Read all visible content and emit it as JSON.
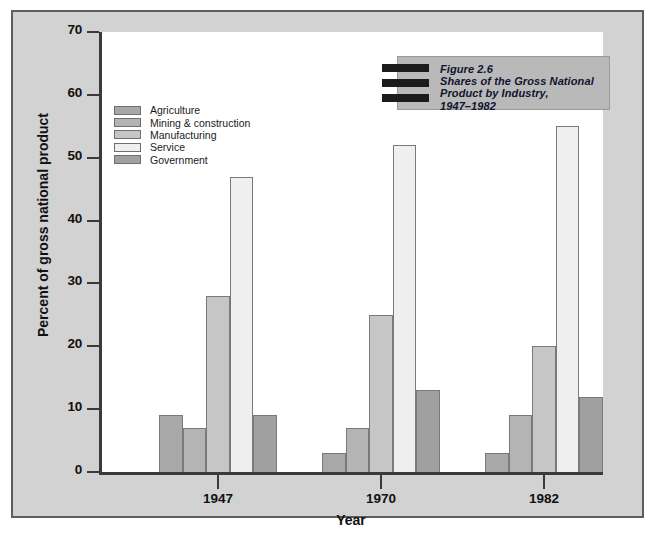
{
  "chart_data": {
    "type": "bar",
    "title_lines": [
      "Figure 2.6",
      "Shares of the Gross National",
      "Product by Industry,",
      "1947–1982"
    ],
    "xlabel": "Year",
    "ylabel": "Percent of gross national product",
    "categories": [
      "1947",
      "1970",
      "1982"
    ],
    "ylim": [
      0,
      70
    ],
    "yticks": [
      0,
      10,
      20,
      30,
      40,
      50,
      60,
      70
    ],
    "grid": false,
    "legend_position": "upper-left-inside",
    "series": [
      {
        "name": "Agriculture",
        "values": [
          9,
          3,
          3
        ],
        "color": "#a8a8a8"
      },
      {
        "name": "Mining & construction",
        "values": [
          7,
          7,
          9
        ],
        "color": "#b4b4b4"
      },
      {
        "name": "Manufacturing",
        "values": [
          28,
          25,
          20
        ],
        "color": "#c6c6c6"
      },
      {
        "name": "Service",
        "values": [
          47,
          52,
          55
        ],
        "color": "#efefef"
      },
      {
        "name": "Government",
        "values": [
          9,
          13,
          12
        ],
        "color": "#a0a0a0"
      }
    ]
  },
  "caption": {
    "text": ""
  },
  "colors": {
    "panel_background": "#d2d2d2",
    "panel_border": "#5d5d5d",
    "plot_background": "#ffffff",
    "axis": "#3a3a3a",
    "title_box": "#b9b9b9",
    "title_text": "#10142e",
    "bar_outline": "#7a7a7a"
  }
}
